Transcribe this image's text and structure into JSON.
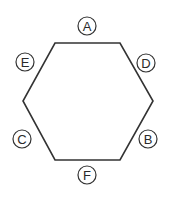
{
  "diagram": {
    "shape": "hexagon",
    "stroke_color": "#333333",
    "labels": [
      {
        "id": "A",
        "text": "A",
        "position": "top",
        "cx": 87,
        "cy": 26
      },
      {
        "id": "D",
        "text": "D",
        "position": "upper-right",
        "cx": 146,
        "cy": 63
      },
      {
        "id": "B",
        "text": "B",
        "position": "lower-right",
        "cx": 148,
        "cy": 139
      },
      {
        "id": "F",
        "text": "F",
        "position": "bottom",
        "cx": 87,
        "cy": 175
      },
      {
        "id": "C",
        "text": "C",
        "position": "lower-left",
        "cx": 22,
        "cy": 139
      },
      {
        "id": "E",
        "text": "E",
        "position": "upper-left",
        "cx": 25,
        "cy": 62
      }
    ]
  }
}
